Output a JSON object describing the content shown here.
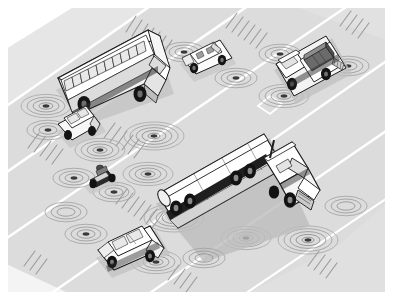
{
  "scene": {
    "title": "Vehicle-to-vehicle communication on a multi-lane highway",
    "kind": "isometric grayscale technical illustration",
    "caption": "",
    "frame": {
      "x": 8,
      "y": 8,
      "width": 377,
      "height": 284,
      "background": "#ffffff"
    },
    "palette": {
      "page_background": "#ffffff",
      "road_surface": "#d9d9d9",
      "road_surface_light": "#e3e3e3",
      "road_shoulder": "#ebebeb",
      "lane_line": "#ffffff",
      "dash_stroke": "#9a9a9a",
      "wave_arc": "#8c8c8c",
      "vehicle_body": "#ffffff",
      "vehicle_outline": "#1a1a1a",
      "vehicle_shadow": "#b4b4b4",
      "glass_fill": "#e8e8e8",
      "tire_dark": "#151515",
      "cargo_dark": "#5a5a5a",
      "cargo_mid": "#8f8f8f"
    },
    "road": {
      "direction": "diagonal from lower-left to upper-right",
      "lane_count": 5,
      "markings": [
        {
          "name": "solid-lane-line",
          "count": 5,
          "style": "solid white"
        },
        {
          "name": "dashed-lane-hatch",
          "count": 6,
          "style": "short gray strokes"
        },
        {
          "name": "hov-diamond",
          "count": 1,
          "style": "white diamond outline"
        }
      ]
    },
    "vehicles": [
      {
        "id": "school-bus",
        "label": "School bus",
        "type": "bus",
        "lane": 2,
        "window_count": 11,
        "wave_emitters": 3,
        "shadow": true
      },
      {
        "id": "hatchback",
        "label": "Hatchback car",
        "type": "car",
        "lane": 1,
        "wave_emitters": 2,
        "shadow": true
      },
      {
        "id": "convertible",
        "label": "Convertible car",
        "type": "car",
        "lane": 4,
        "wave_emitters": 2,
        "shadow": true
      },
      {
        "id": "flatbed-truck",
        "label": "Flatbed cargo truck",
        "type": "truck",
        "lane": 5,
        "wave_emitters": 3,
        "shadow": true
      },
      {
        "id": "motorcycle",
        "label": "Motorcycle with rider",
        "type": "motorcycle",
        "lane": 1,
        "wave_emitters": 2,
        "shadow": true
      },
      {
        "id": "sedan",
        "label": "Sedan car",
        "type": "car",
        "lane": 1,
        "wave_emitters": 2,
        "shadow": true
      },
      {
        "id": "tanker-truck",
        "label": "Tanker semi-truck",
        "type": "semi-truck",
        "lane": 3,
        "axle_groups": 3,
        "wave_emitters": 4,
        "shadow": true
      }
    ],
    "waves": {
      "name": "radio-wave-arcs",
      "description": "concentric arcs radiating from each vehicle sensor point",
      "ring_counts": [
        3,
        4,
        5
      ]
    }
  }
}
